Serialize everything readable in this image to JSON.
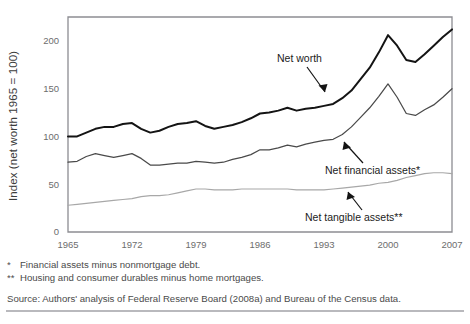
{
  "axes": {
    "ylabel": "Index (net worth 1965 = 100)",
    "yticks": [
      "0",
      "50",
      "100",
      "150",
      "200"
    ],
    "xticks": [
      "1965",
      "1972",
      "1979",
      "1986",
      "1993",
      "2000",
      "2007"
    ]
  },
  "annotations": {
    "net_worth": "Net worth",
    "net_financial": "Net financial assets*",
    "net_tangible": "Net tangible assets**"
  },
  "footnotes": [
    {
      "mark": "*",
      "text": "Financial assets minus nonmortgage debt."
    },
    {
      "mark": "**",
      "text": "Housing and consumer durables minus home mortgages."
    }
  ],
  "source": "Source: Authors' analysis of Federal Reserve Board (2008a) and Bureau of the Census data.",
  "colors": {
    "net_worth": "#141414",
    "net_financial": "#4a4a4a",
    "net_tangible": "#a8a8a8",
    "axis": "#8d8d92",
    "rule": "#b9b9bd"
  },
  "chart_data": {
    "type": "line",
    "title": "",
    "xlabel": "",
    "ylabel": "Index (net worth 1965 = 100)",
    "xlim": [
      1965,
      2007
    ],
    "ylim": [
      0,
      225
    ],
    "yticks": [
      0,
      50,
      100,
      150,
      200
    ],
    "xticks": [
      1965,
      1972,
      1979,
      1986,
      1993,
      2000,
      2007
    ],
    "grid": false,
    "legend": "annotations-inline",
    "x": [
      1965,
      1966,
      1967,
      1968,
      1969,
      1970,
      1971,
      1972,
      1973,
      1974,
      1975,
      1976,
      1977,
      1978,
      1979,
      1980,
      1981,
      1982,
      1983,
      1984,
      1985,
      1986,
      1987,
      1988,
      1989,
      1990,
      1991,
      1992,
      1993,
      1994,
      1995,
      1996,
      1997,
      1998,
      1999,
      2000,
      2001,
      2002,
      2003,
      2004,
      2005,
      2006,
      2007
    ],
    "series": [
      {
        "name": "Net worth",
        "color": "#141414",
        "values": [
          100,
          100,
          104,
          108,
          110,
          110,
          113,
          114,
          108,
          104,
          106,
          110,
          113,
          114,
          116,
          111,
          108,
          110,
          112,
          115,
          119,
          124,
          125,
          127,
          130,
          127,
          129,
          130,
          132,
          134,
          140,
          148,
          160,
          172,
          188,
          206,
          195,
          180,
          178,
          186,
          195,
          204,
          212
        ]
      },
      {
        "name": "Net financial assets*",
        "color": "#4a4a4a",
        "values": [
          73,
          74,
          79,
          82,
          80,
          78,
          80,
          82,
          77,
          70,
          70,
          71,
          72,
          72,
          74,
          73,
          72,
          73,
          76,
          78,
          81,
          86,
          86,
          88,
          91,
          89,
          92,
          94,
          96,
          97,
          102,
          110,
          120,
          130,
          142,
          155,
          141,
          124,
          122,
          128,
          133,
          141,
          150
        ]
      },
      {
        "name": "Net tangible assets**",
        "color": "#a8a8a8",
        "values": [
          28,
          29,
          30,
          31,
          32,
          33,
          34,
          35,
          37,
          38,
          38,
          39,
          41,
          43,
          45,
          45,
          44,
          44,
          44,
          45,
          45,
          45,
          45,
          45,
          45,
          44,
          44,
          44,
          44,
          45,
          46,
          47,
          48,
          49,
          51,
          52,
          54,
          57,
          59,
          61,
          62,
          62,
          61
        ]
      }
    ],
    "notes": [
      "* Financial assets minus nonmortgage debt.",
      "** Housing and consumer durables minus home mortgages."
    ],
    "source": "Source: Authors' analysis of Federal Reserve Board (2008a) and Bureau of the Census data."
  }
}
